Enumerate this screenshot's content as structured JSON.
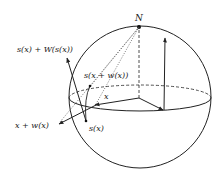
{
  "diagram": {
    "labels": {
      "north_pole": "N",
      "s_plus_W": "s(x) + W(s(x))",
      "s_x_plus_w": "s(x + w(x))",
      "x": "x",
      "x_plus_w": "x + w(x)",
      "s_x": "s(x)"
    },
    "colors": {
      "stroke": "#222222",
      "background": "#ffffff"
    }
  }
}
